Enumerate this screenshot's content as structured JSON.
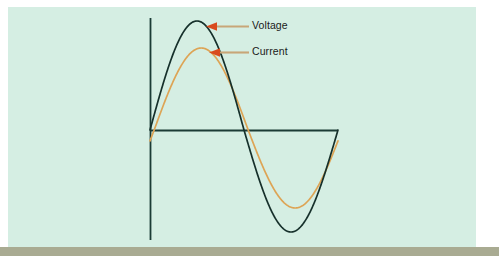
{
  "figure": {
    "width": 499,
    "height": 262,
    "background_color": "#ffffff",
    "panel_color": "#d5eee3",
    "base_bar_color": "#a9ab92"
  },
  "annotations": [
    {
      "id": "voltage",
      "label": "Voltage",
      "arrow_color": "#d94a1e",
      "leader_color": "#c8a678",
      "points_to": "voltage-waveform-peak"
    },
    {
      "id": "current",
      "label": "Current",
      "arrow_color": "#d94a1e",
      "leader_color": "#c8a678",
      "points_to": "current-waveform-peak"
    }
  ],
  "axes": {
    "vertical_axis_color": "#1b3b35",
    "horizontal_axis_color": "#1b3b35",
    "origin": {
      "x": 150,
      "y": 130
    },
    "vertical_top": 18,
    "vertical_bottom": 240,
    "horizontal_right": 338
  },
  "chart_data": {
    "type": "line",
    "title": "",
    "subtitle": "",
    "xlabel": "",
    "ylabel": "",
    "grid": false,
    "legend": "inline-annotations",
    "x_range_degrees": [
      0,
      360
    ],
    "series": [
      {
        "name": "Voltage",
        "color": "#16302b",
        "line_width": 1.7,
        "amplitude": 109,
        "phase_lag_degrees": 0,
        "peak": {
          "x_deg": 90,
          "value": 109
        },
        "zero_crossing_deg": 180,
        "trough": {
          "x_deg": 270,
          "value": -102
        }
      },
      {
        "name": "Current",
        "color": "#dda455",
        "line_width": 1.7,
        "amplitude": 82,
        "phase_lag_degrees": 8,
        "peak": {
          "x_deg": 98,
          "value": 82
        },
        "zero_crossing_deg": 188,
        "trough": {
          "x_deg": 278,
          "value": -78
        }
      }
    ]
  }
}
